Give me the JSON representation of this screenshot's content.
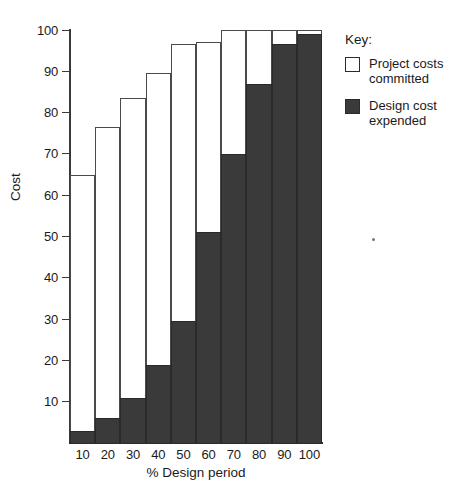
{
  "chart_data": {
    "type": "bar",
    "title": "",
    "subtitle": "",
    "xlabel": "% Design period",
    "ylabel": "Cost",
    "xlim": [
      0,
      100
    ],
    "ylim": [
      0,
      100
    ],
    "grid": false,
    "stacked_overlay": true,
    "legend_position": "right",
    "legend_title": "Key:",
    "categories": [
      "10",
      "20",
      "30",
      "40",
      "50",
      "60",
      "70",
      "80",
      "90",
      "100"
    ],
    "x_tick_labels": [
      "10",
      "20",
      "30",
      "40",
      "50",
      "60",
      "70",
      "80",
      "90",
      "100"
    ],
    "y_tick_labels": [
      "10",
      "20",
      "30",
      "40",
      "50",
      "60",
      "70",
      "80",
      "90",
      "100"
    ],
    "y_ticks": [
      10,
      20,
      30,
      40,
      50,
      60,
      70,
      80,
      90,
      100
    ],
    "series": [
      {
        "name": "Project costs committed",
        "color": "#ffffff",
        "edge_color": "#4a4a4a",
        "values": [
          65,
          76.5,
          83.5,
          89.5,
          96.5,
          97,
          100,
          100,
          100,
          100
        ]
      },
      {
        "name": "Design cost expended",
        "color": "#3a3a3a",
        "edge_color": "#2a2a2a",
        "values": [
          3,
          6,
          11,
          19,
          29.5,
          51,
          70,
          87,
          96.5,
          99
        ]
      }
    ]
  },
  "axes": {
    "y_title": "Cost",
    "x_title": "% Design period"
  },
  "key": {
    "title": "Key:",
    "entries": [
      {
        "label_line1": "Project costs",
        "label_line2": "committed",
        "swatch": "white-square-icon"
      },
      {
        "label_line1": "Design cost",
        "label_line2": "expended",
        "swatch": "dark-square-icon"
      }
    ]
  }
}
